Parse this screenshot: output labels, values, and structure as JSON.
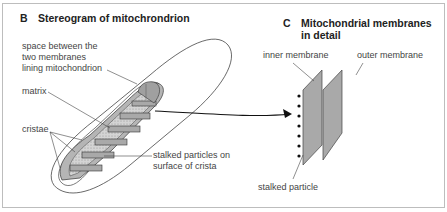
{
  "panel_b": {
    "letter": "B",
    "title": "Stereogram of mitochrondrion",
    "labels": {
      "intermembrane_line1": "space between the",
      "intermembrane_line2": "two membranes",
      "intermembrane_line3": "lining mitochondrion",
      "matrix": "matrix",
      "cristae": "cristae",
      "stalked_line1": "stalked particles on",
      "stalked_line2": "surface of crista"
    }
  },
  "panel_c": {
    "letter": "C",
    "title_line1": "Mitochondrial membranes",
    "title_line2": "in detail",
    "labels": {
      "inner": "inner membrane",
      "outer": "outer membrane",
      "stalked": "stalked particle"
    }
  },
  "colors": {
    "membrane_fill": "#a9a9a9",
    "stipple_fill": "#d2d2d2",
    "outline": "#333333"
  }
}
